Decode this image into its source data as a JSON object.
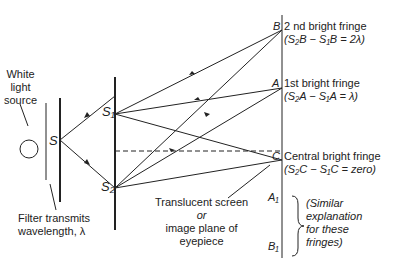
{
  "source": {
    "label_lines": [
      "White",
      "light",
      "source"
    ]
  },
  "filter": {
    "label_lines": [
      "Filter transmits",
      "wavelength, λ"
    ]
  },
  "slits": {
    "single": "S",
    "s1": "S₁",
    "s2": "S₂"
  },
  "screen": {
    "label_lines": [
      "Translucent screen",
      "or",
      "image plane of",
      "eyepiece"
    ],
    "points": {
      "B": "B",
      "A": "A",
      "C": "C",
      "A1": "A₁",
      "B1": "B₁"
    }
  },
  "fringes": [
    {
      "title": "2 nd bright fringe",
      "equation": "(S₂B − S₁B = 2λ)"
    },
    {
      "title": "1st bright fringe",
      "equation": "(S₂A − S₁A = λ)"
    },
    {
      "title": "Central bright fringe",
      "equation": "(S₂C − S₁C = zero)"
    }
  ],
  "similar_note": [
    "(Similar",
    "explanation",
    "for these",
    "fringes)"
  ]
}
